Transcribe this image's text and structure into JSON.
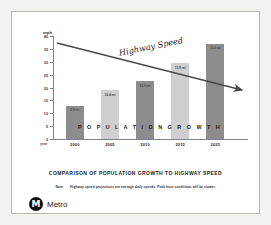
{
  "slide": {
    "title": "COMPARISON OF POPULATION GROWTH TO HIGHWAY SPEED",
    "note_label": "Note:",
    "note_text": "Highway speed projections are average daily speeds.  Peak hour conditions will be slower.",
    "logo_mark": "M",
    "logo_text": "Metro"
  },
  "chart_data": {
    "type": "bar",
    "title": "COMPARISON OF POPULATION GROWTH TO HIGHWAY SPEED",
    "xlabel": "year",
    "ylabel": "mph",
    "ylim": [
      0,
      40
    ],
    "yticks": [
      0,
      5,
      10,
      15,
      20,
      25,
      30,
      35,
      40
    ],
    "grid": false,
    "categories": [
      "2000",
      "2005",
      "2010",
      "2015",
      "2025"
    ],
    "values": [
      13.0,
      19.0,
      22.5,
      29.5,
      37.0
    ],
    "bar_labels": [
      "9.0 mi",
      "10.4 mi",
      "12.0 mi",
      "11.9 mi",
      "13.2 mi"
    ],
    "bar_colors": [
      "#8d8d8d",
      "#cfcfcf",
      "#8d8d8d",
      "#cfcfcf",
      "#8d8d8d"
    ],
    "series_overlay_label": "P O P U L A T I O N   G R O W T H",
    "annotations": [
      {
        "name": "highway-speed-arrow",
        "label": "Highway Speed",
        "type": "arrow",
        "start_value": 35.0,
        "end_value": 17.0,
        "direction": "declining",
        "color": "#4a4a4a"
      }
    ]
  }
}
